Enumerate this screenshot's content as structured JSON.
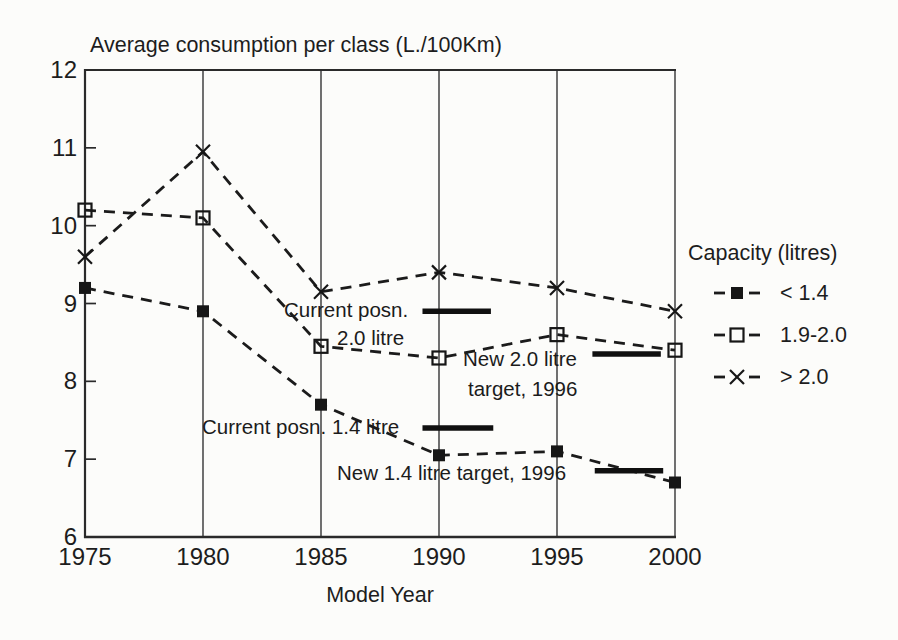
{
  "chart_data": {
    "type": "line",
    "title": "Average consumption per class (L./100Km)",
    "xlabel": "Model Year",
    "ylabel": "",
    "xlim": [
      1975,
      2000
    ],
    "ylim": [
      6,
      12
    ],
    "xticks": [
      1975,
      1980,
      1985,
      1990,
      1995,
      2000
    ],
    "yticks": [
      12,
      11,
      10,
      9,
      8,
      7,
      6
    ],
    "grid": "vertical-only",
    "line_style": "dashed",
    "line_color": "#1b1b1b",
    "x": [
      1975,
      1980,
      1985,
      1990,
      1995,
      2000
    ],
    "series": [
      {
        "name": "< 1.4",
        "marker": "filled-square",
        "values": [
          9.2,
          8.9,
          7.7,
          7.05,
          7.1,
          6.7
        ]
      },
      {
        "name": "1.9-2.0",
        "marker": "open-square",
        "values": [
          10.2,
          10.1,
          8.45,
          8.3,
          8.6,
          8.4
        ]
      },
      {
        "name": "> 2.0",
        "marker": "x-cross",
        "values": [
          9.6,
          10.95,
          9.15,
          9.4,
          9.2,
          8.9
        ]
      }
    ],
    "legend": {
      "title": "Capacity (litres)",
      "position": "right"
    },
    "target_bars": [
      {
        "label": "Current posn. 2.0 litre",
        "value": 8.9,
        "year_start": 1989.3,
        "year_end": 1992.2
      },
      {
        "label": "New 2.0 litre target, 1996",
        "value": 8.35,
        "year_start": 1996.5,
        "year_end": 1999.4
      },
      {
        "label": "Current posn. 1.4 litre",
        "value": 7.4,
        "year_start": 1989.3,
        "year_end": 1992.3
      },
      {
        "label": "New 1.4 litre target, 1996",
        "value": 6.85,
        "year_start": 1996.6,
        "year_end": 1999.5
      }
    ],
    "annotations": [
      {
        "text": "Current posn.",
        "left": 284,
        "top": 298
      },
      {
        "text": "2.0 litre",
        "left": 337,
        "top": 326
      },
      {
        "text": "New 2.0 litre",
        "left": 463,
        "top": 347
      },
      {
        "text": "target, 1996",
        "left": 468,
        "top": 377
      },
      {
        "text": "Current posn. 1.4 litre",
        "left": 202,
        "top": 415
      },
      {
        "text": "New 1.4 litre target, 1996",
        "left": 337,
        "top": 461
      }
    ]
  }
}
